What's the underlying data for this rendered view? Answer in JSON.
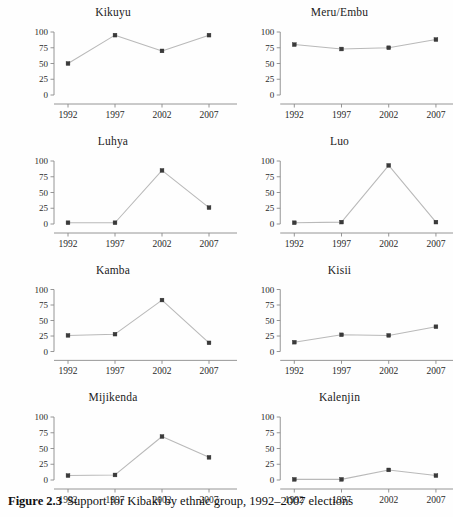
{
  "caption": {
    "label": "Figure 2.3",
    "text": "Support for Kibaki by ethnic group, 1992–2007 elections"
  },
  "chart_data": {
    "type": "line",
    "title": "Support for Kibaki by ethnic group, 1992–2007 elections",
    "xlabel": "",
    "ylabel": "",
    "x": [
      1992,
      1997,
      2002,
      2007
    ],
    "categories": [
      "1992",
      "1997",
      "2002",
      "2007"
    ],
    "xtick_labels": [
      "1992",
      "1997",
      "2002",
      "2007"
    ],
    "ytick_labels": [
      "0",
      "25",
      "50",
      "75",
      "100"
    ],
    "ytick_values": [
      0,
      25,
      50,
      75,
      100
    ],
    "ylim": [
      0,
      100
    ],
    "grid": false,
    "legend": false,
    "legend_position": "none",
    "layout": "2 columns x 4 rows of small multiples",
    "marker": "filled-square",
    "line_color": "#b9b9b9",
    "marker_color": "#3a3a3a",
    "panels": [
      {
        "title": "Kikuyu",
        "name": "kikuyu",
        "values": [
          50,
          95,
          70,
          95
        ]
      },
      {
        "title": "Meru/Embu",
        "name": "meru-embu",
        "values": [
          80,
          73,
          75,
          88
        ]
      },
      {
        "title": "Luhya",
        "name": "luhya",
        "values": [
          2,
          2,
          85,
          26
        ]
      },
      {
        "title": "Luo",
        "name": "luo",
        "values": [
          2,
          3,
          93,
          3
        ]
      },
      {
        "title": "Kamba",
        "name": "kamba",
        "values": [
          26,
          28,
          83,
          14
        ]
      },
      {
        "title": "Kisii",
        "name": "kisii",
        "values": [
          15,
          27,
          26,
          40
        ]
      },
      {
        "title": "Mijikenda",
        "name": "mijikenda",
        "values": [
          7,
          8,
          69,
          36
        ]
      },
      {
        "title": "Kalenjin",
        "name": "kalenjin",
        "values": [
          1,
          1,
          16,
          7
        ]
      }
    ]
  }
}
